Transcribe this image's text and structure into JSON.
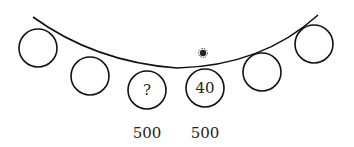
{
  "diagram": {
    "marker": {
      "x": 203,
      "y": 53,
      "color": "#222222"
    },
    "circles": [
      {
        "cx": 38,
        "cy": 48,
        "r": 19,
        "label": ""
      },
      {
        "cx": 90,
        "cy": 76,
        "r": 19,
        "label": ""
      },
      {
        "cx": 147,
        "cy": 90,
        "r": 19,
        "label": "?"
      },
      {
        "cx": 205,
        "cy": 88,
        "r": 19,
        "label": "40"
      },
      {
        "cx": 262,
        "cy": 72,
        "r": 19,
        "label": ""
      },
      {
        "cx": 314,
        "cy": 44,
        "r": 19,
        "label": ""
      }
    ],
    "under_labels": [
      {
        "x": 147,
        "y": 133,
        "text": "500"
      },
      {
        "x": 205,
        "y": 133,
        "text": "500"
      }
    ]
  }
}
